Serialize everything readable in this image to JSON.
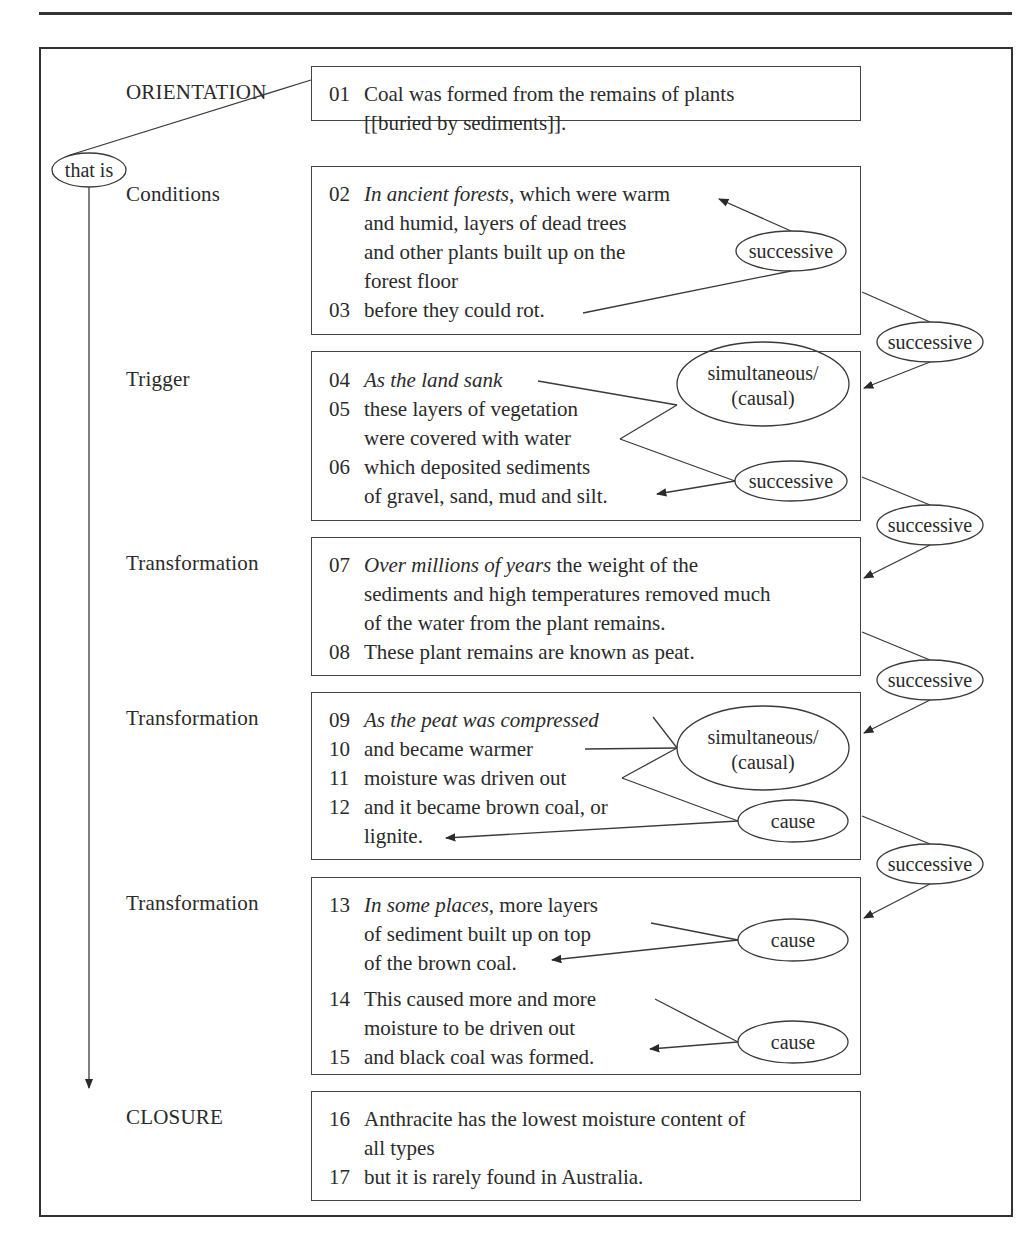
{
  "diagram": {
    "stages": [
      {
        "label": "ORIENTATION"
      },
      {
        "label": "Conditions"
      },
      {
        "label": "Trigger"
      },
      {
        "label": "Transformation"
      },
      {
        "label": "Transformation"
      },
      {
        "label": "Transformation"
      },
      {
        "label": "CLOSURE"
      }
    ],
    "left_link_label": "that is",
    "clauses": [
      {
        "num": "01",
        "lines": [
          {
            "italic": "",
            "plain": "Coal was formed from the remains of plants"
          },
          {
            "italic": "",
            "plain": "[[buried by sediments]]."
          }
        ]
      },
      {
        "num": "02",
        "lines": [
          {
            "italic": "In ancient forests",
            "plain": ", which were warm"
          },
          {
            "italic": "",
            "plain": "and humid, layers of dead trees"
          },
          {
            "italic": "",
            "plain": "and other plants built up on the"
          },
          {
            "italic": "",
            "plain": "forest floor"
          }
        ]
      },
      {
        "num": "03",
        "lines": [
          {
            "italic": "",
            "plain": "before they could rot."
          }
        ]
      },
      {
        "num": "04",
        "lines": [
          {
            "italic": "As the land sank",
            "plain": ""
          }
        ]
      },
      {
        "num": "05",
        "lines": [
          {
            "italic": "",
            "plain": "these layers of vegetation"
          },
          {
            "italic": "",
            "plain": "were covered with water"
          }
        ]
      },
      {
        "num": "06",
        "lines": [
          {
            "italic": "",
            "plain": "which deposited sediments"
          },
          {
            "italic": "",
            "plain": "of gravel, sand, mud and silt."
          }
        ]
      },
      {
        "num": "07",
        "lines": [
          {
            "italic": "Over millions of years",
            "plain": " the weight of the"
          },
          {
            "italic": "",
            "plain": "sediments and high temperatures removed much"
          },
          {
            "italic": "",
            "plain": "of the water from the plant remains."
          }
        ]
      },
      {
        "num": "08",
        "lines": [
          {
            "italic": "",
            "plain": "These plant remains are known as peat."
          }
        ]
      },
      {
        "num": "09",
        "lines": [
          {
            "italic": "As the peat was compressed",
            "plain": ""
          }
        ]
      },
      {
        "num": "10",
        "lines": [
          {
            "italic": "",
            "plain": "and became warmer"
          }
        ]
      },
      {
        "num": "11",
        "lines": [
          {
            "italic": "",
            "plain": "moisture was driven out"
          }
        ]
      },
      {
        "num": "12",
        "lines": [
          {
            "italic": "",
            "plain": "and it became brown coal, or"
          },
          {
            "italic": "",
            "plain": "lignite."
          }
        ]
      },
      {
        "num": "13",
        "lines": [
          {
            "italic": "In some places",
            "plain": ", more layers"
          },
          {
            "italic": "",
            "plain": "of sediment built up on top"
          },
          {
            "italic": "",
            "plain": "of the brown coal."
          }
        ]
      },
      {
        "num": "14",
        "lines": [
          {
            "italic": "",
            "plain": "This caused more and more"
          },
          {
            "italic": "",
            "plain": "moisture to be driven out"
          }
        ]
      },
      {
        "num": "15",
        "lines": [
          {
            "italic": "",
            "plain": "and black coal was formed."
          }
        ]
      },
      {
        "num": "16",
        "lines": [
          {
            "italic": "",
            "plain": "Anthracite has the lowest moisture content of"
          },
          {
            "italic": "",
            "plain": "all types"
          }
        ]
      },
      {
        "num": "17",
        "lines": [
          {
            "italic": "",
            "plain": "but it is rarely found in Australia."
          }
        ]
      }
    ],
    "inner_relations": [
      {
        "label": "successive"
      },
      {
        "label_line1": "simultaneous/",
        "label_line2": "(causal)"
      },
      {
        "label": "successive"
      },
      {
        "label_line1": "simultaneous/",
        "label_line2": "(causal)"
      },
      {
        "label": "cause"
      },
      {
        "label": "cause"
      },
      {
        "label": "cause"
      }
    ],
    "outer_relations": [
      {
        "label": "successive"
      },
      {
        "label": "successive"
      },
      {
        "label": "successive"
      },
      {
        "label": "successive"
      }
    ]
  }
}
